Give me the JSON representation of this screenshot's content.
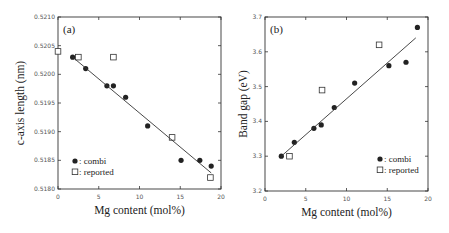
{
  "chart_data": [
    {
      "type": "scatter",
      "panel_label": "(a)",
      "title": "",
      "xlabel": "Mg content (mol%)",
      "ylabel": "c-axis length (nm)",
      "xlim": [
        0,
        20
      ],
      "ylim": [
        0.518,
        0.521
      ],
      "xticks": [
        "0",
        "5",
        "10",
        "15",
        "20"
      ],
      "yticks": [
        "0.5180",
        "0.5185",
        "0.5190",
        "0.5195",
        "0.5200",
        "0.5205",
        "0.5210"
      ],
      "legend": [
        {
          "marker": "filled-circle",
          "label": ": combi"
        },
        {
          "marker": "open-square",
          "label": ": reported"
        }
      ],
      "legend_position": "lower-left",
      "grid": false,
      "series": [
        {
          "name": "combi",
          "marker": "filled-circle",
          "x": [
            1.8,
            3.4,
            6.0,
            6.8,
            8.3,
            11.0,
            15.1,
            17.4,
            18.8
          ],
          "y": [
            0.5203,
            0.5201,
            0.5198,
            0.5198,
            0.5196,
            0.5191,
            0.5185,
            0.5185,
            0.5184
          ]
        },
        {
          "name": "reported",
          "marker": "open-square",
          "x": [
            0.0,
            2.5,
            6.8,
            14.0,
            18.7
          ],
          "y": [
            0.5204,
            0.5203,
            0.5203,
            0.5189,
            0.5182
          ]
        },
        {
          "name": "fit",
          "type": "line",
          "x": [
            1.8,
            18.8
          ],
          "y": [
            0.5203,
            0.51828
          ]
        }
      ]
    },
    {
      "type": "scatter",
      "panel_label": "(b)",
      "title": "",
      "xlabel": "Mg content (mol%)",
      "ylabel": "Band gap (eV)",
      "xlim": [
        0,
        20
      ],
      "ylim": [
        3.2,
        3.7
      ],
      "xticks": [
        "0",
        "5",
        "10",
        "15",
        "20"
      ],
      "yticks": [
        "3.2",
        "3.3",
        "3.4",
        "3.5",
        "3.6",
        "3.7"
      ],
      "legend": [
        {
          "marker": "filled-circle",
          "label": ": combi"
        },
        {
          "marker": "open-square",
          "label": ": reported"
        }
      ],
      "legend_position": "lower-right",
      "grid": false,
      "series": [
        {
          "name": "combi",
          "marker": "filled-circle",
          "x": [
            2.0,
            3.6,
            6.0,
            6.9,
            8.5,
            11.0,
            15.2,
            17.3,
            18.7
          ],
          "y": [
            3.3,
            3.34,
            3.38,
            3.39,
            3.44,
            3.51,
            3.56,
            3.57,
            3.67
          ]
        },
        {
          "name": "reported",
          "marker": "open-square",
          "x": [
            3.0,
            7.0,
            14.0
          ],
          "y": [
            3.3,
            3.49,
            3.62
          ]
        },
        {
          "name": "fit",
          "type": "line",
          "x": [
            2.0,
            18.5
          ],
          "y": [
            3.3,
            3.64
          ]
        }
      ]
    }
  ]
}
